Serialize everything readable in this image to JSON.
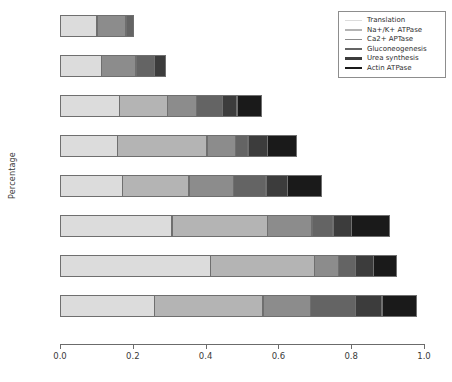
{
  "chart_data": {
    "type": "bar",
    "orientation": "horizontal",
    "stacked": true,
    "title": "",
    "xlabel": "",
    "ylabel": "Percentage",
    "xlim": [
      0.0,
      1.0
    ],
    "xticks": [
      "0.0",
      "0.2",
      "0.4",
      "0.6",
      "0.8",
      "1.0"
    ],
    "xtick_values": [
      0.0,
      0.2,
      0.4,
      0.6,
      0.8,
      1.0
    ],
    "grid": false,
    "legend_position": "top-right",
    "categories": [
      "1",
      "2",
      "3",
      "4",
      "5",
      "6",
      "7",
      "8"
    ],
    "series": [
      {
        "name": "Translation",
        "color": "#dcdcdc",
        "values": [
          0.102,
          0.115,
          0.165,
          0.159,
          0.173,
          0.308,
          0.415,
          0.261
        ]
      },
      {
        "name": "Na+/K+ ATPase",
        "color": "#b4b4b4",
        "values": [
          0.0,
          0.0,
          0.132,
          0.247,
          0.184,
          0.264,
          0.286,
          0.299
        ]
      },
      {
        "name": "Ca2+ APTase",
        "color": "#8c8c8c",
        "values": [
          0.082,
          0.096,
          0.082,
          0.08,
          0.124,
          0.124,
          0.069,
          0.132
        ]
      },
      {
        "name": "Gluconeogenesis",
        "color": "#646464",
        "values": [
          0.022,
          0.052,
          0.074,
          0.036,
          0.091,
          0.06,
          0.047,
          0.126
        ]
      },
      {
        "name": "Urea synthesis",
        "color": "#3c3c3c",
        "values": [
          0.0,
          0.033,
          0.041,
          0.055,
          0.06,
          0.052,
          0.052,
          0.074
        ]
      },
      {
        "name": "Actin ATPase",
        "color": "#1a1a1a",
        "values": [
          0.0,
          0.0,
          0.069,
          0.082,
          0.096,
          0.107,
          0.066,
          0.096
        ]
      }
    ],
    "bar_totals": [
      0.206,
      0.296,
      0.563,
      0.659,
      0.728,
      0.915,
      0.935,
      0.988
    ]
  },
  "legend": {
    "items": [
      {
        "label": "Translation",
        "color": "#dcdcdc"
      },
      {
        "label": "Na+/K+ ATPase",
        "color": "#b4b4b4"
      },
      {
        "label": "Ca2+ APTase",
        "color": "#8c8c8c"
      },
      {
        "label": "Gluconeogenesis",
        "color": "#646464"
      },
      {
        "label": "Urea synthesis",
        "color": "#3c3c3c"
      },
      {
        "label": "Actin ATPase",
        "color": "#1a1a1a"
      }
    ]
  },
  "axes": {
    "ylabel": "Percentage",
    "xtick_labels": [
      "0.0",
      "0.2",
      "0.4",
      "0.6",
      "0.8",
      "1.0"
    ]
  }
}
